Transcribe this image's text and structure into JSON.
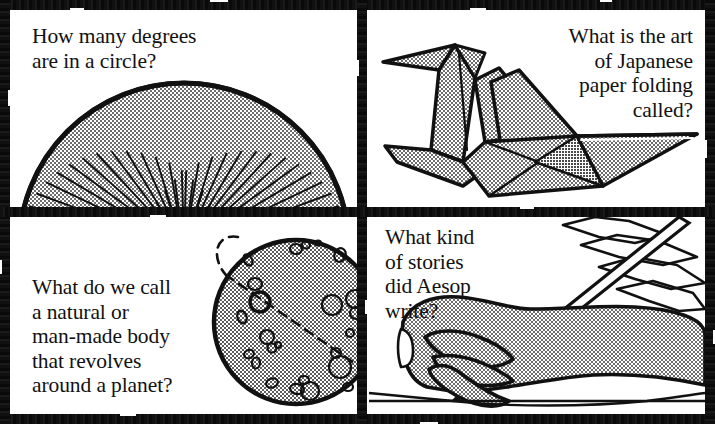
{
  "page": {
    "kind": "trivia-question-card-grid",
    "panel_count": 4,
    "ink_color": "#111111",
    "paper_color": "#ffffff",
    "halftone_gray": "#b9b9b9",
    "background_color": "#fdfdfd"
  },
  "panels": [
    {
      "id": "panel-top-left",
      "position": "top-left",
      "question": "How many degrees\nare in a circle?",
      "text_align": "left",
      "illustration": "protractor-fan-semicircle",
      "illustration_description": "Gray halftone semicircular fan divided into many radial wedge segments, like a protractor or folding fan",
      "segment_count": 36
    },
    {
      "id": "panel-top-right",
      "position": "top-right",
      "question": "What is the art\nof Japanese\npaper folding\ncalled?",
      "text_align": "right",
      "illustration": "origami-crane",
      "illustration_description": "Folded paper crane with gray halftone facets, head and neck at upper left, tail extending to the right"
    },
    {
      "id": "panel-bottom-left",
      "position": "bottom-left",
      "question": "What do we call\na natural or\nman-made body\nthat revolves\naround a planet?",
      "text_align": "left",
      "illustration": "moon-with-orbit",
      "illustration_description": "Gray cratered moon sphere with a dashed elliptical orbit line passing across and behind it"
    },
    {
      "id": "panel-bottom-right",
      "position": "bottom-right",
      "question": "What kind\nof stories\ndid Aesop\nwrite?",
      "text_align": "left",
      "illustration": "hand-with-quill-pen",
      "illustration_description": "Gray halftone hand gripping a feather quill pen, writing on a horizontal ruled line"
    }
  ]
}
